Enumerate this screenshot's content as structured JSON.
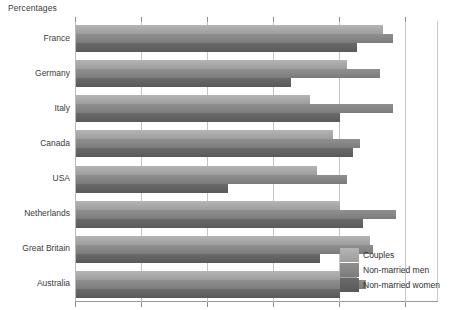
{
  "chart_data": {
    "type": "bar",
    "orientation": "horizontal",
    "title": "Percentages",
    "xlabel": "",
    "ylabel": "",
    "xlim": [
      0,
      110
    ],
    "grid": true,
    "gridlines": [
      0,
      20,
      40,
      60,
      80,
      100
    ],
    "legend_position": "bottom-right",
    "categories": [
      "France",
      "Germany",
      "Italy",
      "Canada",
      "USA",
      "Netherlands",
      "Great Britain",
      "Australia"
    ],
    "series": [
      {
        "name": "Couples",
        "color": "#a8a8a8",
        "values": [
          93,
          82,
          71,
          78,
          73,
          80,
          89,
          85
        ]
      },
      {
        "name": "Non-married men",
        "color": "#858585",
        "values": [
          96,
          92,
          96,
          86,
          82,
          97,
          90,
          88
        ]
      },
      {
        "name": "Non-married women",
        "color": "#616161",
        "values": [
          85,
          65,
          80,
          84,
          46,
          87,
          74,
          80
        ]
      }
    ]
  },
  "legend": {
    "items": [
      {
        "label": "Couples"
      },
      {
        "label": "Non-married men"
      },
      {
        "label": "Non-married women"
      }
    ]
  }
}
